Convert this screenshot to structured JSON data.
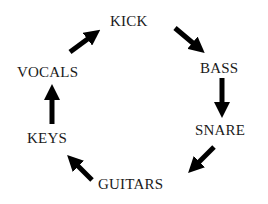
{
  "diagram": {
    "type": "cycle",
    "text_color": "#1a1a1a",
    "arrow_color": "#000000",
    "nodes": [
      {
        "id": "kick",
        "label": "KICK"
      },
      {
        "id": "bass",
        "label": "BASS"
      },
      {
        "id": "snare",
        "label": "SNARE"
      },
      {
        "id": "guitars",
        "label": "GUITARS"
      },
      {
        "id": "keys",
        "label": "KEYS"
      },
      {
        "id": "vocals",
        "label": "VOCALS"
      }
    ],
    "edges": [
      {
        "from": "kick",
        "to": "bass"
      },
      {
        "from": "bass",
        "to": "snare"
      },
      {
        "from": "snare",
        "to": "guitars"
      },
      {
        "from": "guitars",
        "to": "keys"
      },
      {
        "from": "keys",
        "to": "vocals"
      },
      {
        "from": "vocals",
        "to": "kick"
      }
    ]
  }
}
